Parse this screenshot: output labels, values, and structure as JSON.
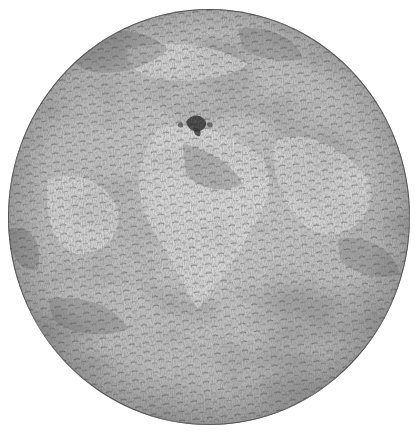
{
  "illustration": {
    "subject": "engraved globe",
    "style": "monochrome hatched engraving",
    "colors": {
      "background": "#ffffff",
      "disc_light": "#d4d4d4",
      "disc_mid": "#b4b4b4",
      "disc_dark": "#6a6a6a",
      "hatch": "#3c3c3c",
      "outline": "#5a5a5a"
    },
    "disc": {
      "left": 8,
      "top": 9,
      "width": 402,
      "height": 416
    }
  },
  "caption": {
    "text": ""
  }
}
